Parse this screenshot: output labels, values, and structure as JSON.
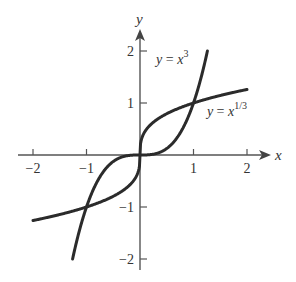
{
  "chart_data": {
    "type": "line",
    "title": "",
    "xlabel": "x",
    "ylabel": "y",
    "xlim": [
      -2,
      2.3
    ],
    "ylim": [
      -2,
      2.2
    ],
    "x_ticks": [
      -2,
      -1,
      1,
      2
    ],
    "y_ticks": [
      -2,
      -1,
      1,
      2
    ],
    "x_tick_labels": [
      "−2",
      "−1",
      "1",
      "2"
    ],
    "y_tick_labels": [
      "−2",
      "−1",
      "1",
      "2"
    ],
    "grid": false,
    "legend": "none",
    "series": [
      {
        "name": "y = x^3",
        "function": "x^3",
        "x_range": [
          -1.26,
          1.26
        ],
        "label": {
          "prefix": "y = x",
          "sup": "3",
          "anchor_x": 0.3,
          "anchor_y": 1.75
        }
      },
      {
        "name": "y = x^(1/3)",
        "function": "x^(1/3)",
        "x_range": [
          -2,
          2
        ],
        "label": {
          "prefix": "y = x",
          "sup": "1/3",
          "anchor_x": 1.25,
          "anchor_y": 0.75
        }
      }
    ],
    "annotations": [
      "y = x^3",
      "y = x^(1/3)"
    ],
    "color": "#2b2b2b"
  }
}
